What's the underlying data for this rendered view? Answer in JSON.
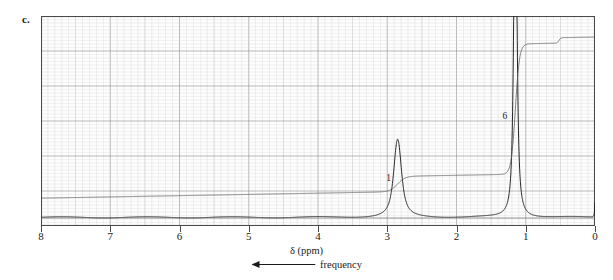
{
  "figure": {
    "panel_label": "c.",
    "type": "nmr-spectrum"
  },
  "axis": {
    "title": "δ (ppm)",
    "direction_label": "frequency",
    "direction_arrow": "left-arrow-icon",
    "tick_labels": [
      "8",
      "7",
      "6",
      "5",
      "4",
      "3",
      "2",
      "1",
      "0"
    ],
    "x_min_ppm": 0,
    "x_max_ppm": 8,
    "reversed": true,
    "major_grid_ppm": 0.5,
    "minor_grid_ppm": 0.1
  },
  "colors": {
    "frame": "#4a4a4a",
    "major_grid": "#9a9a9a",
    "minor_grid": "#d8d8d8",
    "trace": "#1a1a1a",
    "integral": "#5d5d5d",
    "text": "#1a1a1a"
  },
  "integration_labels": [
    {
      "text": "1",
      "ppm": 2.98,
      "height_frac": 0.19
    },
    {
      "text": "6",
      "ppm": 1.3,
      "height_frac": 0.5
    }
  ],
  "chart_data": {
    "type": "line",
    "title": "",
    "xlabel": "δ (ppm)",
    "ylabel": "",
    "xlim": [
      8,
      0
    ],
    "ylim": [
      0,
      1
    ],
    "grid": true,
    "legend": "none",
    "x_axis_reversed": true,
    "annotations": [
      "c.",
      "1",
      "6",
      "frequency"
    ],
    "series": [
      {
        "name": "spectrum",
        "description": "1H NMR trace: baseline with a septet at 2.85 ppm (1H) and a strong doublet at 1.15 ppm (6H), plus TMS reference at 0 ppm",
        "peaks": [
          {
            "ppm": 2.85,
            "rel_height": 0.145,
            "multiplicity": "septet",
            "integral": 1,
            "width_ppm": 0.1
          },
          {
            "ppm": 1.15,
            "rel_height": 0.945,
            "multiplicity": "doublet",
            "integral": 6,
            "width_ppm": 0.045
          },
          {
            "ppm": 0.0,
            "rel_height": 0.075,
            "multiplicity": "singlet",
            "integral": 0,
            "width_ppm": 0.012
          }
        ],
        "baseline_rel": 0.018
      },
      {
        "name": "integral",
        "description": "Integration trace rising left-to-right; small step at the 2.85 ppm septet, large step at the 1.15 ppm doublet, small step near 0.5 ppm",
        "steps": [
          {
            "ppm": 2.85,
            "rise_rel": 0.085
          },
          {
            "ppm": 1.15,
            "rise_rel": 0.72
          },
          {
            "ppm": 0.52,
            "rise_rel": 0.03
          }
        ],
        "start_rel": 0.06,
        "end_rel": 0.955
      }
    ]
  }
}
